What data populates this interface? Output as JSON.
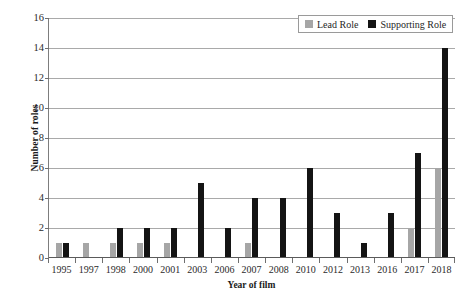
{
  "chart_data": {
    "type": "bar",
    "title": "",
    "xlabel": "Year of film",
    "ylabel": "Number of roles",
    "ylim": [
      0,
      16
    ],
    "ytick_step": 2,
    "yticks": [
      16,
      14,
      12,
      10,
      8,
      6,
      4,
      2,
      0
    ],
    "grid": true,
    "legend_position": "top-right",
    "categories": [
      "1995",
      "1997",
      "1998",
      "2000",
      "2001",
      "2003",
      "2006",
      "2007",
      "2008",
      "2010",
      "2012",
      "2013",
      "2016",
      "2017",
      "2018"
    ],
    "series": [
      {
        "name": "Lead Role",
        "color": "#a6a6a6",
        "values": [
          1,
          1,
          1,
          1,
          1,
          0,
          0,
          1,
          0,
          0,
          0,
          0,
          0,
          2,
          6
        ]
      },
      {
        "name": "Supporting Role",
        "color": "#141414",
        "values": [
          1,
          0,
          2,
          2,
          2,
          5,
          2,
          4,
          4,
          6,
          3,
          1,
          3,
          7,
          14
        ]
      }
    ]
  },
  "legend": {
    "entries": [
      {
        "label": "Lead Role",
        "swatch": "lead-role-swatch"
      },
      {
        "label": "Supporting Role",
        "swatch": "supporting-role-swatch"
      }
    ]
  }
}
